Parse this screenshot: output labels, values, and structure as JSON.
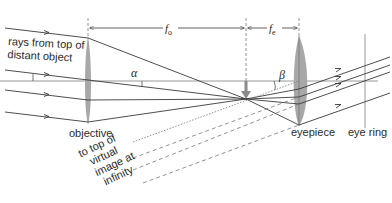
{
  "diagram": {
    "type": "telescope-ray-diagram",
    "labels": {
      "rays": [
        "rays from top of",
        "distant object"
      ],
      "objective": "objective",
      "eyepiece": "eyepiece",
      "eye_ring": "eye ring",
      "virtual_image": [
        "to top of",
        "virtual",
        "image at",
        "infinity"
      ],
      "focal_objective_main": "f",
      "focal_objective_sub": "o",
      "focal_eyepiece_main": "f",
      "focal_eyepiece_sub": "e",
      "angle_alpha": "α",
      "angle_beta": "β"
    },
    "colors": {
      "line": "#3a3a3a",
      "lens": "#a8a8a8",
      "axis": "#8c8c8c",
      "image_arrow": "#8a8a8a",
      "text": "#2b2b2b"
    },
    "components": [
      {
        "name": "objective lens",
        "x": 88
      },
      {
        "name": "focal point / intermediate image",
        "x": 246
      },
      {
        "name": "eyepiece lens",
        "x": 299
      },
      {
        "name": "eye ring",
        "x": 365
      }
    ]
  }
}
